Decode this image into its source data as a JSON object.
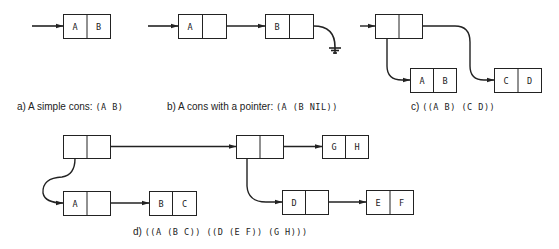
{
  "colors": {
    "ink": "#222222",
    "background": "#ffffff"
  },
  "panels": {
    "a": {
      "caption_prefix": "a)  A simple cons:",
      "caption_expr": "(A  B)",
      "cells": [
        {
          "car": "A",
          "cdr": "B"
        }
      ]
    },
    "b": {
      "caption_prefix": "b)  A cons with a pointer:",
      "caption_expr": "(A  (B  NIL))",
      "cells": [
        {
          "car": "A",
          "cdr": ""
        },
        {
          "car": "B",
          "cdr": ""
        }
      ],
      "terminator": "ground-nil"
    },
    "c": {
      "caption_prefix": "c)",
      "caption_expr": "((A  B)  (C  D))",
      "cells": [
        {
          "car": "",
          "cdr": ""
        },
        {
          "car": "A",
          "cdr": "B"
        },
        {
          "car": "C",
          "cdr": "D"
        }
      ]
    },
    "d": {
      "caption_prefix": "d)",
      "caption_expr": "((A  (B  C))  ((D  (E  F))  (G  H)))",
      "cells": [
        {
          "car": "",
          "cdr": ""
        },
        {
          "car": "A",
          "cdr": ""
        },
        {
          "car": "B",
          "cdr": "C"
        },
        {
          "car": "",
          "cdr": ""
        },
        {
          "car": "G",
          "cdr": "H"
        },
        {
          "car": "D",
          "cdr": ""
        },
        {
          "car": "E",
          "cdr": "F"
        }
      ]
    }
  }
}
